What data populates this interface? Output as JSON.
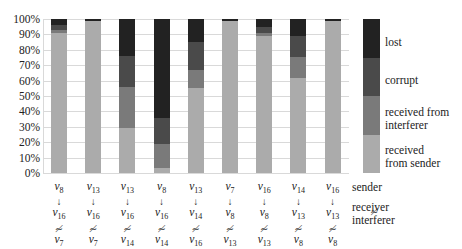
{
  "chart_data": {
    "type": "bar",
    "stacked": true,
    "title": "",
    "xlabel": "",
    "ylabel": "",
    "ylim": [
      0,
      100
    ],
    "yticks": [
      "0%",
      "10%",
      "20%",
      "30%",
      "40%",
      "50%",
      "60%",
      "70%",
      "80%",
      "90%",
      "100%"
    ],
    "grid": true,
    "legend_position": "right",
    "categories": [
      {
        "sender": "v8",
        "receiver": "v16",
        "interferer": "v7"
      },
      {
        "sender": "v13",
        "receiver": "v16",
        "interferer": "v7"
      },
      {
        "sender": "v13",
        "receiver": "v16",
        "interferer": "v14"
      },
      {
        "sender": "v8",
        "receiver": "v16",
        "interferer": "v14"
      },
      {
        "sender": "v13",
        "receiver": "v14",
        "interferer": "v16"
      },
      {
        "sender": "v7",
        "receiver": "v8",
        "interferer": "v13"
      },
      {
        "sender": "v16",
        "receiver": "v8",
        "interferer": "v13"
      },
      {
        "sender": "v14",
        "receiver": "v13",
        "interferer": "v8"
      },
      {
        "sender": "v16",
        "receiver": "v13",
        "interferer": "v8"
      }
    ],
    "series": [
      {
        "name": "received from sender",
        "color": "#ababab",
        "values": [
          91,
          99,
          29,
          3,
          55,
          99,
          89,
          62,
          99
        ]
      },
      {
        "name": "received from interferer",
        "color": "#7a7a7a",
        "values": [
          2,
          0,
          27,
          16,
          12,
          0,
          2,
          13,
          0
        ]
      },
      {
        "name": "corrupt",
        "color": "#4a4a4a",
        "values": [
          3,
          0,
          20,
          17,
          18,
          0,
          4,
          14,
          0
        ]
      },
      {
        "name": "lost",
        "color": "#222222",
        "values": [
          4,
          1,
          24,
          64,
          15,
          1,
          5,
          11,
          1
        ]
      }
    ],
    "row_labels": [
      "sender",
      "receiver",
      "interferer"
    ]
  }
}
